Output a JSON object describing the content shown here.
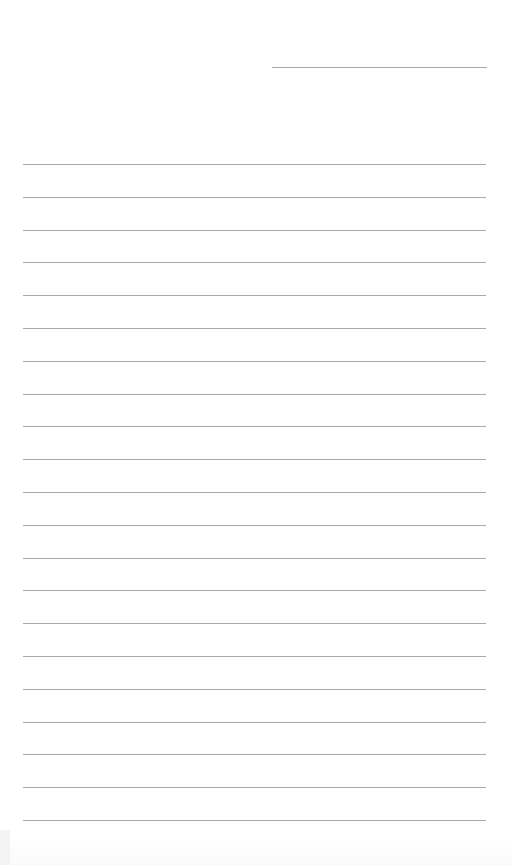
{
  "page": {
    "type": "blank lined sheet",
    "background_color": "#ffffff",
    "line_color": "#a9a9a9",
    "header_line": {
      "purpose": "blank header/name line",
      "text": ""
    },
    "ruled_lines": {
      "count": 21,
      "entries": [
        "",
        "",
        "",
        "",
        "",
        "",
        "",
        "",
        "",
        "",
        "",
        "",
        "",
        "",
        "",
        "",
        "",
        "",
        "",
        "",
        ""
      ]
    }
  }
}
